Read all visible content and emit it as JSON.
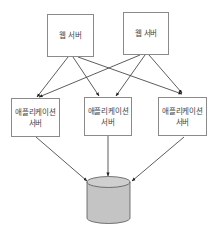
{
  "diagram": {
    "type": "architecture",
    "web_servers": [
      {
        "id": "web1",
        "label": "웹 서버"
      },
      {
        "id": "web2",
        "label": "웹 서버"
      }
    ],
    "app_servers": [
      {
        "id": "app1",
        "line1": "애플리케이션",
        "line2": "서버"
      },
      {
        "id": "app2",
        "line1": "애플리케이션",
        "line2": "서버"
      },
      {
        "id": "app3",
        "line1": "애플리케이션",
        "line2": "서버"
      }
    ],
    "database": {
      "id": "db",
      "shape": "cylinder"
    },
    "edges": [
      {
        "from": "web1",
        "to": "app1"
      },
      {
        "from": "web1",
        "to": "app2"
      },
      {
        "from": "web1",
        "to": "app3"
      },
      {
        "from": "web2",
        "to": "app1"
      },
      {
        "from": "web2",
        "to": "app2"
      },
      {
        "from": "web2",
        "to": "app3"
      },
      {
        "from": "app1",
        "to": "db"
      },
      {
        "from": "app2",
        "to": "db"
      },
      {
        "from": "app3",
        "to": "db"
      }
    ],
    "colors": {
      "line": "#333333",
      "box_border": "#8a8a8a",
      "db_fill": "#c4c4c4",
      "db_top": "#cfcfcf",
      "db_stroke": "#555555"
    }
  }
}
